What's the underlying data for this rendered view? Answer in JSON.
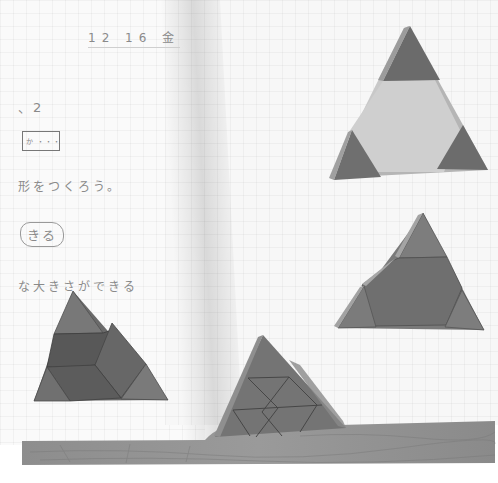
{
  "scene": {
    "description": "Open grid notebook on a wooden table with four triangle-shaped wooden puzzle arrangements",
    "colors": {
      "paper": "#f7f7f7",
      "grid": "#e6e6e6",
      "ink": "#8a8a8a",
      "piece_dark": "#6e6e6e",
      "piece_mid": "#7c7c7c",
      "piece_light": "#c9c9c9",
      "piece_edge": "#a8a8a8",
      "table": "#8f8f8f"
    }
  },
  "notebook": {
    "left_page": {
      "date_line": "12 16 金",
      "lines": [
        "、2",
        "",
        "形をつくろう。",
        "きる",
        "な大きさができる"
      ],
      "boxed_note": "か ・・・"
    }
  },
  "puzzles": [
    {
      "id": "top-right",
      "label": "large triangle with light hexagon center and three dark corner triangles"
    },
    {
      "id": "middle-right",
      "label": "large triangle made of dark trapezoid pieces and small triangles"
    },
    {
      "id": "bottom-left",
      "label": "triangle composed of rhombus and trapezoid pieces"
    },
    {
      "id": "bottom-center",
      "label": "triangle composed of many small triangles"
    }
  ]
}
